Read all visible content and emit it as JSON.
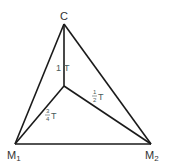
{
  "diagram": {
    "vertices": {
      "C": {
        "label": "C",
        "x": 64,
        "y": 24
      },
      "M1": {
        "label": "M",
        "sub": "1",
        "x": 15,
        "y": 144
      },
      "M2": {
        "label": "M",
        "sub": "2",
        "x": 151,
        "y": 144
      },
      "center": {
        "x": 64,
        "y": 86
      }
    },
    "edges": {
      "center_C": {
        "coef": "1",
        "unit": "T"
      },
      "center_M2": {
        "num": "1",
        "den": "2",
        "unit": "T"
      },
      "center_M1": {
        "num": "3",
        "den": "4",
        "unit": "T"
      }
    },
    "colors": {
      "stroke": "#1a1a1a",
      "text": "#333333"
    }
  }
}
